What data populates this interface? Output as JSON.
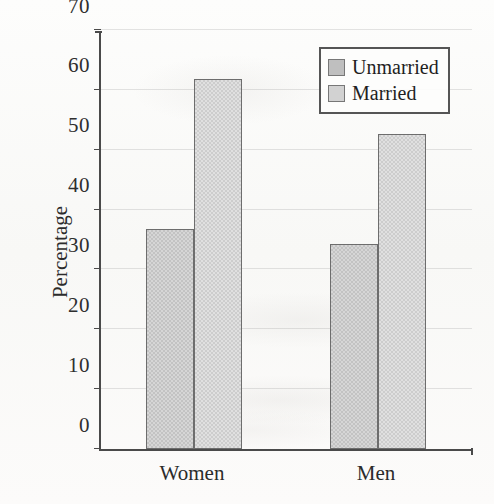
{
  "chart_data": {
    "type": "bar",
    "title": "",
    "xlabel": "",
    "ylabel": "Percentage",
    "ylim": [
      0,
      70
    ],
    "yticks": [
      0,
      10,
      20,
      30,
      40,
      50,
      60,
      70
    ],
    "ytick_labels": [
      "0",
      "10",
      "20",
      "30",
      "40",
      "50",
      "60",
      "70"
    ],
    "categories": [
      "Women",
      "Men"
    ],
    "grid": true,
    "legend_position": "top-right",
    "series": [
      {
        "name": "Unmarried",
        "color": "#c3c3c3",
        "values": [
          36.7,
          34.3
        ]
      },
      {
        "name": "Married",
        "color": "#cdcdcd",
        "values": [
          61.8,
          52.6
        ]
      }
    ]
  },
  "legend": {
    "items": [
      {
        "label": "Unmarried",
        "swatch_class": "unmarried"
      },
      {
        "label": "Married",
        "swatch_class": "married"
      }
    ]
  }
}
